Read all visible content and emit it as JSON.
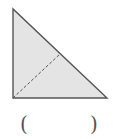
{
  "figure": {
    "shape": "right-triangle",
    "vertices": {
      "top": [
        13,
        9
      ],
      "bottom_left": [
        13,
        98
      ],
      "bottom_right": [
        107,
        98
      ]
    },
    "dashed_segment": {
      "from": [
        13,
        98
      ],
      "to": [
        60,
        54
      ]
    },
    "fill_color": "#e4e4e4",
    "stroke_color": "#555555"
  },
  "answer_blank": {
    "open_paren": "(",
    "close_paren": ")",
    "value": ""
  }
}
